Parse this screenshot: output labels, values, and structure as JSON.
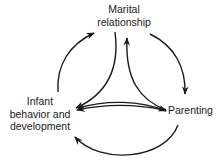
{
  "diagram": {
    "type": "cycle",
    "nodes": [
      {
        "id": "marital",
        "label_lines": [
          "Marital",
          "relationship"
        ]
      },
      {
        "id": "infant",
        "label_lines": [
          "Infant",
          "behavior and",
          "development"
        ]
      },
      {
        "id": "parenting",
        "label_lines": [
          "Parenting"
        ]
      }
    ],
    "edges": [
      {
        "from": "infant",
        "to": "marital",
        "style": "outer-arc"
      },
      {
        "from": "marital",
        "to": "parenting",
        "style": "outer-arc"
      },
      {
        "from": "parenting",
        "to": "infant",
        "style": "outer-arc"
      },
      {
        "from": "marital",
        "to": "infant",
        "style": "inner-curve"
      },
      {
        "from": "parenting",
        "to": "marital",
        "style": "inner-curve"
      },
      {
        "from": "infant",
        "to": "parenting",
        "style": "inner-curve"
      },
      {
        "from": "parenting",
        "to": "infant",
        "style": "inner-curve"
      }
    ],
    "colors": {
      "stroke": "#1a1a1a",
      "background": "#ffffff"
    }
  }
}
